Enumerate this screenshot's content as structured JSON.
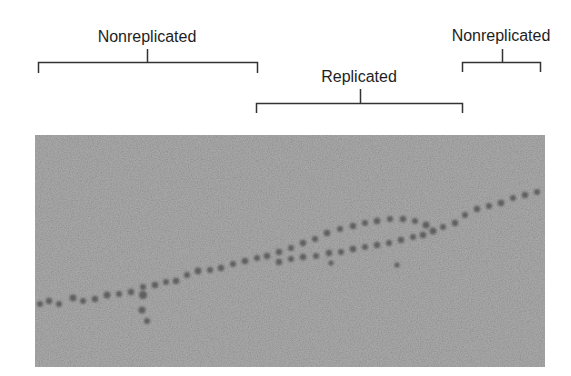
{
  "figure": {
    "labels": {
      "left_nonreplicated": "Nonreplicated",
      "replicated": "Replicated",
      "right_nonreplicated": "Nonreplicated"
    },
    "brackets": [
      {
        "name": "left-nonreplicated",
        "x1": 38,
        "x2": 257,
        "y": 62,
        "tick_dir": "down"
      },
      {
        "name": "replicated",
        "x1": 256,
        "x2": 462,
        "y": 103,
        "tick_dir": "down"
      },
      {
        "name": "right-nonreplicated",
        "x1": 462,
        "x2": 540,
        "y": 62,
        "tick_dir": "down"
      }
    ],
    "micrograph": {
      "description": "Electron micrograph of chromatin showing a replication bubble",
      "background_color": "#9c9c9c",
      "strand_color": "#5a5a5a",
      "line_color": "#333333"
    }
  }
}
